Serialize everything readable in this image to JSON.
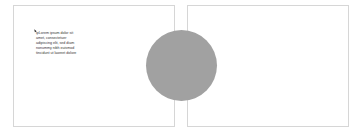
{
  "document": {
    "pages": [
      {
        "name": "left-page",
        "text": "ipLorem ipsum dolor sit amet, consectetuer adipiscing elit, sed diam nonummy nibh euismod tincidunt ut laoreet dolore"
      },
      {
        "name": "right-page"
      }
    ],
    "shape": {
      "type": "circle",
      "fill": "#a1a1a1"
    }
  }
}
